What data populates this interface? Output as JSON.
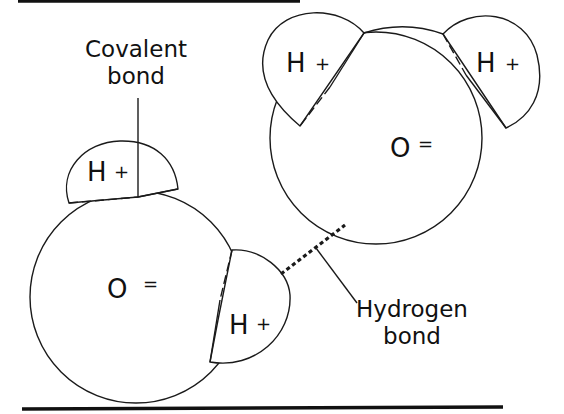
{
  "diagram": {
    "type": "water molecules hydrogen bonding",
    "molecules": [
      {
        "id": "molecule-left",
        "oxygen": {
          "symbol": "O",
          "charge": "="
        },
        "hydrogens": [
          {
            "symbol": "H",
            "charge": "+"
          },
          {
            "symbol": "H",
            "charge": "+"
          }
        ]
      },
      {
        "id": "molecule-right",
        "oxygen": {
          "symbol": "O",
          "charge": "="
        },
        "hydrogens": [
          {
            "symbol": "H",
            "charge": "+"
          },
          {
            "symbol": "H",
            "charge": "+"
          }
        ]
      }
    ],
    "labels": {
      "covalent_line1": "Covalent",
      "covalent_line2": "bond",
      "hydrogen_line1": "Hydrogen",
      "hydrogen_line2": "bond"
    },
    "colors": {
      "stroke": "#1a1a1a",
      "background": "#ffffff"
    }
  }
}
